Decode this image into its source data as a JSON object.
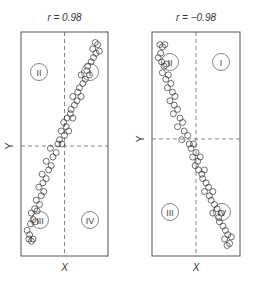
{
  "chart_data": [
    {
      "type": "scatter",
      "title": "r = 0.98",
      "xlabel": "X",
      "ylabel": "Y",
      "grid": false,
      "mean_lines": "dashed",
      "quadrant_labels": [
        "I",
        "II",
        "III",
        "IV"
      ],
      "correlation": 0.98,
      "trend": "positive",
      "xlim": [
        0,
        1
      ],
      "ylim": [
        0,
        1
      ],
      "points": [
        [
          0.07,
          0.06
        ],
        [
          0.1,
          0.05
        ],
        [
          0.12,
          0.06
        ],
        [
          0.08,
          0.08
        ],
        [
          0.05,
          0.1
        ],
        [
          0.09,
          0.13
        ],
        [
          0.12,
          0.15
        ],
        [
          0.15,
          0.14
        ],
        [
          0.1,
          0.18
        ],
        [
          0.14,
          0.2
        ],
        [
          0.17,
          0.19
        ],
        [
          0.2,
          0.22
        ],
        [
          0.16,
          0.24
        ],
        [
          0.22,
          0.26
        ],
        [
          0.25,
          0.28
        ],
        [
          0.19,
          0.3
        ],
        [
          0.24,
          0.32
        ],
        [
          0.28,
          0.34
        ],
        [
          0.23,
          0.36
        ],
        [
          0.31,
          0.38
        ],
        [
          0.34,
          0.4
        ],
        [
          0.28,
          0.42
        ],
        [
          0.36,
          0.44
        ],
        [
          0.4,
          0.46
        ],
        [
          0.33,
          0.48
        ],
        [
          0.42,
          0.5
        ],
        [
          0.44,
          0.52
        ],
        [
          0.47,
          0.5
        ],
        [
          0.5,
          0.54
        ],
        [
          0.46,
          0.56
        ],
        [
          0.52,
          0.58
        ],
        [
          0.49,
          0.6
        ],
        [
          0.55,
          0.56
        ],
        [
          0.53,
          0.62
        ],
        [
          0.57,
          0.64
        ],
        [
          0.6,
          0.62
        ],
        [
          0.58,
          0.66
        ],
        [
          0.62,
          0.68
        ],
        [
          0.65,
          0.7
        ],
        [
          0.6,
          0.72
        ],
        [
          0.66,
          0.74
        ],
        [
          0.7,
          0.72
        ],
        [
          0.68,
          0.76
        ],
        [
          0.72,
          0.78
        ],
        [
          0.75,
          0.8
        ],
        [
          0.7,
          0.82
        ],
        [
          0.77,
          0.84
        ],
        [
          0.8,
          0.82
        ],
        [
          0.78,
          0.86
        ],
        [
          0.82,
          0.88
        ],
        [
          0.85,
          0.9
        ],
        [
          0.88,
          0.92
        ],
        [
          0.84,
          0.94
        ],
        [
          0.9,
          0.96
        ],
        [
          0.92,
          0.93
        ],
        [
          0.87,
          0.97
        ]
      ]
    },
    {
      "type": "scatter",
      "title": "r = −0.98",
      "xlabel": "X",
      "ylabel": "Y",
      "grid": false,
      "mean_lines": "dashed",
      "quadrant_labels": [
        "I",
        "II",
        "III",
        "IV"
      ],
      "correlation": -0.98,
      "trend": "negative",
      "xlim": [
        0,
        1
      ],
      "ylim": [
        0,
        1
      ],
      "points": [
        [
          0.07,
          0.96
        ],
        [
          0.1,
          0.95
        ],
        [
          0.13,
          0.96
        ],
        [
          0.08,
          0.92
        ],
        [
          0.05,
          0.9
        ],
        [
          0.09,
          0.88
        ],
        [
          0.12,
          0.86
        ],
        [
          0.15,
          0.87
        ],
        [
          0.1,
          0.83
        ],
        [
          0.14,
          0.8
        ],
        [
          0.17,
          0.82
        ],
        [
          0.2,
          0.78
        ],
        [
          0.16,
          0.76
        ],
        [
          0.22,
          0.74
        ],
        [
          0.25,
          0.72
        ],
        [
          0.19,
          0.7
        ],
        [
          0.24,
          0.68
        ],
        [
          0.28,
          0.66
        ],
        [
          0.23,
          0.64
        ],
        [
          0.31,
          0.62
        ],
        [
          0.34,
          0.6
        ],
        [
          0.28,
          0.58
        ],
        [
          0.36,
          0.56
        ],
        [
          0.4,
          0.54
        ],
        [
          0.33,
          0.52
        ],
        [
          0.42,
          0.5
        ],
        [
          0.44,
          0.48
        ],
        [
          0.47,
          0.5
        ],
        [
          0.5,
          0.46
        ],
        [
          0.46,
          0.44
        ],
        [
          0.52,
          0.42
        ],
        [
          0.49,
          0.4
        ],
        [
          0.55,
          0.44
        ],
        [
          0.53,
          0.38
        ],
        [
          0.57,
          0.36
        ],
        [
          0.6,
          0.38
        ],
        [
          0.58,
          0.34
        ],
        [
          0.62,
          0.32
        ],
        [
          0.65,
          0.3
        ],
        [
          0.6,
          0.28
        ],
        [
          0.66,
          0.26
        ],
        [
          0.7,
          0.28
        ],
        [
          0.68,
          0.24
        ],
        [
          0.72,
          0.22
        ],
        [
          0.75,
          0.2
        ],
        [
          0.7,
          0.18
        ],
        [
          0.77,
          0.16
        ],
        [
          0.8,
          0.18
        ],
        [
          0.78,
          0.14
        ],
        [
          0.82,
          0.12
        ],
        [
          0.85,
          0.1
        ],
        [
          0.88,
          0.08
        ],
        [
          0.84,
          0.06
        ],
        [
          0.9,
          0.04
        ],
        [
          0.92,
          0.07
        ],
        [
          0.87,
          0.03
        ]
      ]
    }
  ],
  "panels": [
    {
      "title": "r = 0.98",
      "xlabel": "X",
      "ylabel": "Y",
      "quadrants": {
        "tl": "II",
        "tr": "I",
        "bl": "III",
        "br": "IV"
      }
    },
    {
      "title": "r = −0.98",
      "xlabel": "X",
      "ylabel": "Y",
      "quadrants": {
        "tl": "II",
        "tr": "I",
        "bl": "III",
        "br": "IV"
      }
    }
  ],
  "style": {
    "frame_color": "#555555",
    "marker_stroke": "#333333",
    "dash_color": "#666666"
  }
}
